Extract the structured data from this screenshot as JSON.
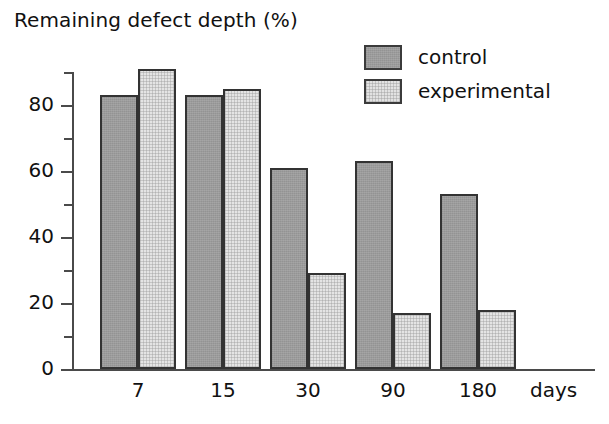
{
  "chart_data": {
    "type": "bar",
    "title": "Remaining defect depth (%)",
    "xlabel": "days",
    "ylabel": "",
    "categories": [
      "7",
      "15",
      "30",
      "90",
      "180"
    ],
    "series": [
      {
        "name": "control",
        "color": "#9b9b9b",
        "values": [
          83,
          83,
          61,
          63,
          53
        ]
      },
      {
        "name": "experimental",
        "color": "#e4e4e4",
        "values": [
          91,
          85,
          29,
          17,
          18
        ]
      }
    ],
    "ylim": [
      0,
      95
    ],
    "y_major_ticks": [
      0,
      20,
      40,
      60,
      80
    ],
    "y_minor_ticks": [
      10,
      30,
      50,
      70,
      90
    ],
    "y_tick_labels": [
      "0",
      "20",
      "40",
      "60",
      "80"
    ],
    "grid": false,
    "legend_position": "top-right"
  },
  "legend": {
    "items": [
      {
        "label": "control"
      },
      {
        "label": "experimental"
      }
    ]
  },
  "axis": {
    "x_title": "days",
    "y_labels": [
      "80",
      "60",
      "40",
      "20",
      "0"
    ],
    "x_labels": [
      "7",
      "15",
      "30",
      "90",
      "180"
    ]
  },
  "colors": {
    "control": "#9b9b9b",
    "experimental": "#e4e4e4",
    "axis": "#4a4a4a",
    "bar_outline": "#333333",
    "text": "#111111",
    "background": "#ffffff"
  }
}
